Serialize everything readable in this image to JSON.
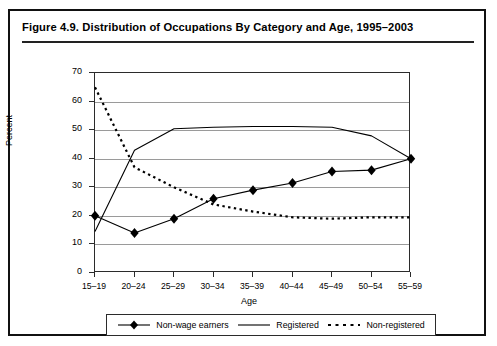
{
  "figure": {
    "title": "Figure 4.9.  Distribution of Occupations By Category and Age, 1995–2003"
  },
  "axes": {
    "ylabel": "Percent",
    "xlabel": "Age",
    "yticks": [
      "70",
      "60",
      "50",
      "40",
      "30",
      "20",
      "10",
      "0"
    ],
    "xticks": [
      "15–19",
      "20–24",
      "25–29",
      "30–34",
      "35–39",
      "40–44",
      "45–49",
      "50–54",
      "55–59"
    ]
  },
  "legend": {
    "items": [
      {
        "label": "Non-wage earners",
        "style": "line-marker"
      },
      {
        "label": "Registered",
        "style": "line"
      },
      {
        "label": "Non-registered",
        "style": "dotted"
      }
    ]
  },
  "chart_data": {
    "type": "line",
    "title": "Figure 4.9.  Distribution of Occupations By Category and Age, 1995–2003",
    "xlabel": "Age",
    "ylabel": "Percent",
    "ylim": [
      0,
      70
    ],
    "ytick_step": 10,
    "grid": true,
    "legend_position": "bottom",
    "categories": [
      "15–19",
      "20–24",
      "25–29",
      "30–34",
      "35–39",
      "40–44",
      "45–49",
      "50–54",
      "55–59"
    ],
    "series": [
      {
        "name": "Non-wage earners",
        "marker": "diamond",
        "line": "solid",
        "color": "#000000",
        "values": [
          20,
          14,
          19,
          26,
          29,
          31.5,
          35.5,
          36,
          40
        ]
      },
      {
        "name": "Registered",
        "marker": "none",
        "line": "solid",
        "color": "#000000",
        "values": [
          14.5,
          43,
          50.5,
          51,
          51.3,
          51.3,
          51,
          48,
          40
        ]
      },
      {
        "name": "Non-registered",
        "marker": "none",
        "line": "dotted",
        "color": "#000000",
        "values": [
          65,
          37,
          30,
          24,
          21.5,
          19.5,
          19,
          19.5,
          19.5
        ]
      }
    ]
  }
}
